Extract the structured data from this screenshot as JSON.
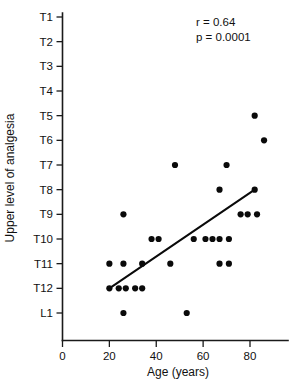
{
  "chart_data": {
    "type": "scatter",
    "title": "",
    "subtitle": "",
    "xlabel": "Age (years)",
    "ylabel": "Upper level of analgesia",
    "xlim": [
      0,
      92
    ],
    "ylim_categories": [
      "T1",
      "T2",
      "T3",
      "T4",
      "T5",
      "T6",
      "T7",
      "T8",
      "T9",
      "T10",
      "T11",
      "T12",
      "L1"
    ],
    "xticks": [
      0,
      20,
      40,
      60,
      80
    ],
    "xticklabels": [
      "0",
      "20",
      "40",
      "60",
      "80"
    ],
    "yticks": [
      "T1",
      "T2",
      "T3",
      "T4",
      "T5",
      "T6",
      "T7",
      "T8",
      "T9",
      "T10",
      "T11",
      "T12",
      "L1"
    ],
    "yticklabels": [
      "T1",
      "T2",
      "T3",
      "T4",
      "T5",
      "T6",
      "T7",
      "T8",
      "T9",
      "T10",
      "T11",
      "T12",
      "L1"
    ],
    "grid": false,
    "legend": false,
    "marker": "filled-circle",
    "marker_color": "#0a0a0a",
    "points": [
      {
        "x": 82,
        "y": "T5"
      },
      {
        "x": 86,
        "y": "T6"
      },
      {
        "x": 48,
        "y": "T7"
      },
      {
        "x": 70,
        "y": "T7"
      },
      {
        "x": 67,
        "y": "T8"
      },
      {
        "x": 82,
        "y": "T8"
      },
      {
        "x": 26,
        "y": "T9"
      },
      {
        "x": 76,
        "y": "T9"
      },
      {
        "x": 79,
        "y": "T9"
      },
      {
        "x": 83,
        "y": "T9"
      },
      {
        "x": 38,
        "y": "T10"
      },
      {
        "x": 41,
        "y": "T10"
      },
      {
        "x": 56,
        "y": "T10"
      },
      {
        "x": 61,
        "y": "T10"
      },
      {
        "x": 64,
        "y": "T10"
      },
      {
        "x": 67,
        "y": "T10"
      },
      {
        "x": 71,
        "y": "T10"
      },
      {
        "x": 20,
        "y": "T11"
      },
      {
        "x": 26,
        "y": "T11"
      },
      {
        "x": 34,
        "y": "T11"
      },
      {
        "x": 46,
        "y": "T11"
      },
      {
        "x": 67,
        "y": "T11"
      },
      {
        "x": 71,
        "y": "T11"
      },
      {
        "x": 20,
        "y": "T12"
      },
      {
        "x": 24,
        "y": "T12"
      },
      {
        "x": 27,
        "y": "T12"
      },
      {
        "x": 31,
        "y": "T12"
      },
      {
        "x": 34,
        "y": "T12"
      },
      {
        "x": 26,
        "y": "L1"
      },
      {
        "x": 53,
        "y": "L1"
      }
    ],
    "fit_line": {
      "x_start": 20,
      "y_start": "T12",
      "x_end": 82,
      "y_end": "T8"
    },
    "annotations": [
      {
        "text": "r = 0.64",
        "x": 62,
        "y": "T1"
      },
      {
        "text": "p = 0.0001",
        "x": 62,
        "y": "T2"
      }
    ]
  },
  "annotation": {
    "correlation": "r = 0.64",
    "pvalue": "p = 0.0001"
  },
  "axes": {
    "x_title": "Age (years)",
    "y_title": "Upper level of analgesia"
  }
}
